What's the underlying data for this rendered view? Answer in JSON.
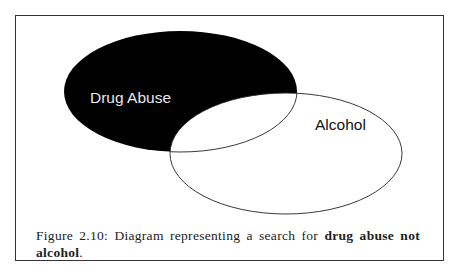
{
  "diagram": {
    "type": "venn",
    "sets": [
      {
        "label": "Drug Abuse",
        "fill": "#000000",
        "text_color": "#e8e8e8",
        "selected": true
      },
      {
        "label": "Alcohol",
        "fill": "#ffffff",
        "text_color": "#111111",
        "selected": false
      }
    ],
    "highlighted_region": "Drug Abuse minus Alcohol"
  },
  "caption": {
    "prefix": "Figure 2.10: Diagram representing a search for ",
    "bold": "drug abuse not alcohol",
    "suffix": "."
  }
}
